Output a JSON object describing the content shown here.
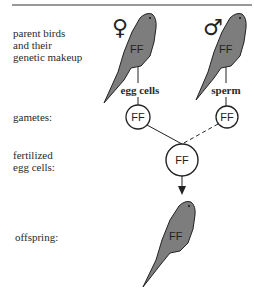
{
  "row_labels": {
    "parents": [
      "parent birds",
      "and their",
      "genetic makeup"
    ],
    "gametes": "gametes:",
    "fertilized": [
      "fertilized",
      "egg cells:"
    ],
    "offspring": "offspring:"
  },
  "parents": {
    "female": {
      "symbol": "♀",
      "genotype": "FF",
      "gamete_label": "egg cells",
      "gamete_genotype": "FF"
    },
    "male": {
      "symbol": "♂",
      "genotype": "FF",
      "gamete_label": "sperm",
      "gamete_genotype": "FF"
    }
  },
  "zygote": {
    "genotype": "FF"
  },
  "offspring": {
    "genotype": "FF"
  },
  "colors": {
    "bird_fill": "#7d7d7d",
    "outline": "#222222",
    "background": "#ffffff"
  }
}
